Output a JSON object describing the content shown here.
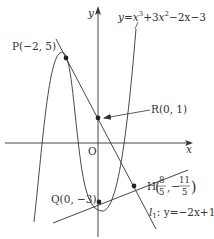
{
  "diagram": {
    "type": "coordinate-graph",
    "axes": {
      "x_label": "x",
      "y_label": "y",
      "origin_label": "O"
    },
    "curve": {
      "equation_label": "y=x³+3x²−2x−3",
      "lhs": "y=",
      "term1_base": "x",
      "term1_exp": "3",
      "plus3": "+3",
      "term2_base": "x",
      "term2_exp": "2",
      "rest": "−2x−3"
    },
    "points": {
      "P": {
        "label": "P(−2, 5)",
        "x": -2,
        "y": 5
      },
      "R": {
        "label": "R(0, 1)",
        "x": 0,
        "y": 1
      },
      "Q": {
        "label": "Q(0, −3)",
        "x": 0,
        "y": -3
      },
      "H": {
        "prefix": "H",
        "x_num": "8",
        "x_den": "5",
        "y_sign": "−",
        "y_num": "11",
        "y_den": "5",
        "comma": ","
      }
    },
    "line_l": {
      "name": "l",
      "subscript": "1",
      "equation": ": y=−2x+1"
    },
    "colors": {
      "stroke": "#333333",
      "background": "#ffffff"
    }
  }
}
